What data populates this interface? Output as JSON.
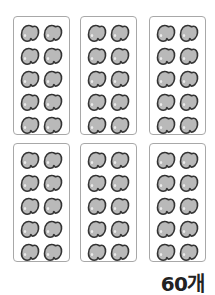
{
  "trays": [
    {
      "row": 0,
      "col": 0,
      "count": 10
    },
    {
      "row": 0,
      "col": 1,
      "count": 10
    },
    {
      "row": 0,
      "col": 2,
      "count": 10
    },
    {
      "row": 1,
      "col": 0,
      "count": 10
    },
    {
      "row": 1,
      "col": 1,
      "count": 10
    },
    {
      "row": 1,
      "col": 2,
      "count": 10
    }
  ],
  "item_icon": "bean-icon",
  "colors": {
    "bean_fill": "#b9b9b9",
    "bean_outline": "#333333",
    "tray_border": "#a8a8a8"
  },
  "total_label": "60개"
}
